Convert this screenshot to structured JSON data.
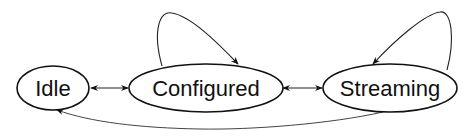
{
  "diagram": {
    "type": "state-machine",
    "colors": {
      "stroke": "#111111",
      "edge": "#222222",
      "background": "#ffffff"
    },
    "nodes": [
      {
        "id": "idle",
        "label": "Idle"
      },
      {
        "id": "configured",
        "label": "Configured"
      },
      {
        "id": "streaming",
        "label": "Streaming"
      }
    ],
    "edges": [
      {
        "from": "idle",
        "to": "configured",
        "direction": "bidirectional"
      },
      {
        "from": "configured",
        "to": "streaming",
        "direction": "bidirectional"
      },
      {
        "from": "configured",
        "to": "configured",
        "direction": "self-loop"
      },
      {
        "from": "streaming",
        "to": "streaming",
        "direction": "self-loop"
      },
      {
        "from": "streaming",
        "to": "idle",
        "direction": "forward"
      }
    ]
  }
}
